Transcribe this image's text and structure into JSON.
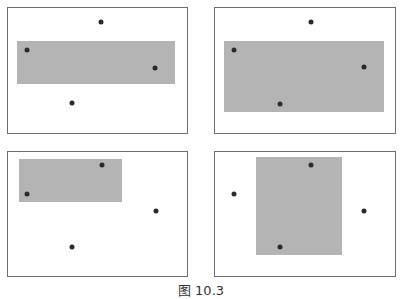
{
  "figure": {
    "caption": "图 10.3",
    "panels": [
      {
        "id": "top-left",
        "frame": {
          "x": 7,
          "y": 7,
          "w": 181,
          "h": 127
        },
        "rect": {
          "x": 17,
          "y": 41,
          "w": 158,
          "h": 43
        },
        "points": [
          [
            27,
            50
          ],
          [
            101,
            22
          ],
          [
            155,
            68
          ],
          [
            72,
            103
          ]
        ]
      },
      {
        "id": "top-right",
        "frame": {
          "x": 214,
          "y": 7,
          "w": 182,
          "h": 127
        },
        "rect": {
          "x": 224,
          "y": 41,
          "w": 160,
          "h": 71
        },
        "points": [
          [
            234,
            50
          ],
          [
            311,
            22
          ],
          [
            364,
            67
          ],
          [
            280,
            104
          ]
        ]
      },
      {
        "id": "bottom-left",
        "frame": {
          "x": 7,
          "y": 151,
          "w": 181,
          "h": 126
        },
        "rect": {
          "x": 19,
          "y": 159,
          "w": 103,
          "h": 43
        },
        "points": [
          [
            27,
            194
          ],
          [
            102,
            165
          ],
          [
            156,
            211
          ],
          [
            72,
            247
          ]
        ]
      },
      {
        "id": "bottom-right",
        "frame": {
          "x": 214,
          "y": 151,
          "w": 182,
          "h": 126
        },
        "rect": {
          "x": 256,
          "y": 157,
          "w": 86,
          "h": 98
        },
        "points": [
          [
            234,
            194
          ],
          [
            311,
            165
          ],
          [
            364,
            211
          ],
          [
            280,
            247
          ]
        ]
      }
    ],
    "colors": {
      "frame": "#6e6e6e",
      "rect": "#b4b4b4",
      "point": "#2a2a2a"
    }
  }
}
